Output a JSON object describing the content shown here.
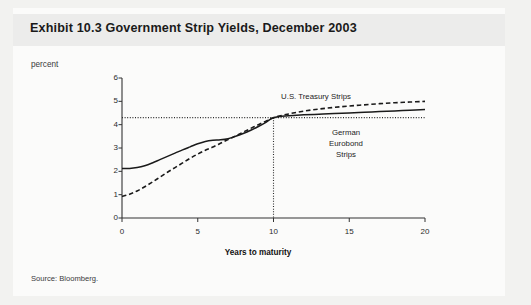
{
  "figure": {
    "title": "Exhibit 10.3 Government Strip Yields, December 2003",
    "unit_label": "percent",
    "source": "Source: Bloomberg."
  },
  "chart_data": {
    "type": "line",
    "title": "Exhibit 10.3 Government Strip Yields, December 2003",
    "subtitle": "",
    "xlabel": "Years to maturity",
    "ylabel": "percent",
    "xlim": [
      0,
      20
    ],
    "ylim": [
      0,
      6
    ],
    "xticks": [
      0,
      5,
      10,
      15,
      20
    ],
    "yticks": [
      0,
      1,
      2,
      3,
      4,
      5,
      6
    ],
    "xtick_labels": [
      "0",
      "5",
      "10",
      "15",
      "20"
    ],
    "ytick_labels": [
      "0",
      "1",
      "2",
      "3",
      "4",
      "5",
      "6"
    ],
    "grid": false,
    "legend_position": "inline-annotation",
    "series": [
      {
        "name": "German Eurobond Strips",
        "style": "solid",
        "color": "#1a1a1a",
        "x": [
          0,
          0.5,
          1,
          1.5,
          2,
          2.5,
          3,
          3.5,
          4,
          4.5,
          5,
          5.5,
          6,
          6.5,
          7,
          7.5,
          8,
          8.5,
          9,
          9.5,
          10,
          11,
          12,
          13,
          14,
          15,
          16,
          17,
          18,
          19,
          20
        ],
        "values": [
          2.12,
          2.12,
          2.16,
          2.24,
          2.36,
          2.5,
          2.64,
          2.78,
          2.92,
          3.05,
          3.18,
          3.28,
          3.33,
          3.35,
          3.4,
          3.5,
          3.62,
          3.76,
          3.92,
          4.1,
          4.3,
          4.38,
          4.42,
          4.45,
          4.48,
          4.5,
          4.53,
          4.56,
          4.59,
          4.62,
          4.65
        ]
      },
      {
        "name": "U.S. Treasury Strips",
        "style": "dashed",
        "color": "#1a1a1a",
        "x": [
          0,
          0.5,
          1,
          1.5,
          2,
          2.5,
          3,
          3.5,
          4,
          4.5,
          5,
          5.5,
          6,
          6.5,
          7,
          7.5,
          8,
          8.5,
          9,
          9.5,
          10,
          11,
          12,
          13,
          14,
          15,
          16,
          17,
          18,
          19,
          20
        ],
        "values": [
          0.92,
          1.02,
          1.16,
          1.34,
          1.54,
          1.75,
          1.96,
          2.16,
          2.36,
          2.56,
          2.74,
          2.9,
          3.04,
          3.2,
          3.36,
          3.52,
          3.68,
          3.84,
          4.0,
          4.15,
          4.3,
          4.46,
          4.58,
          4.67,
          4.74,
          4.8,
          4.85,
          4.9,
          4.94,
          4.97,
          5.0
        ]
      }
    ],
    "annotations": [
      {
        "name": "U.S. Treasury Strips",
        "text": "U.S. Treasury Strips"
      },
      {
        "name": "German Eurobond Strips",
        "text": "German\nEurobond\nStrips"
      }
    ],
    "reference_lines": [
      {
        "name": "crossover-horizontal",
        "orientation": "horizontal",
        "value": 4.3,
        "style": "dotted"
      },
      {
        "name": "crossover-vertical",
        "orientation": "vertical",
        "value": 10,
        "style": "dotted"
      }
    ]
  }
}
